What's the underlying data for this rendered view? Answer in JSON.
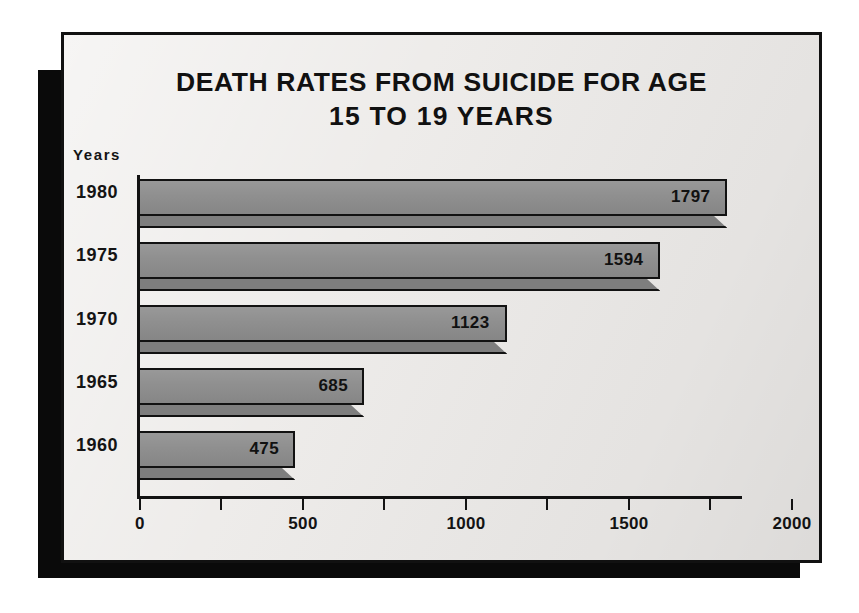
{
  "card": {
    "background_color": "#edebe9",
    "border_color": "#111111",
    "shadow_color": "#0a0a0a"
  },
  "title": {
    "line1": "DEATH RATES FROM SUICIDE FOR AGE",
    "line2": "15 TO 19 YEARS"
  },
  "axis": {
    "y_axis_title": "Years",
    "x_tick_labels": [
      "0",
      "500",
      "1000",
      "1500",
      "2000"
    ],
    "x_tick_values": [
      0,
      500,
      1000,
      1500,
      2000
    ],
    "x_minor_tick_values": [
      250,
      750,
      1250,
      1750
    ]
  },
  "chart_data": {
    "type": "bar",
    "orientation": "horizontal",
    "title": "DEATH RATES FROM SUICIDE FOR AGE 15 TO 19 YEARS",
    "xlabel": "",
    "ylabel": "Years",
    "categories": [
      "1980",
      "1975",
      "1970",
      "1965",
      "1960"
    ],
    "values": [
      1797,
      1594,
      1123,
      685,
      475
    ],
    "data_labels": [
      "1797",
      "1594",
      "1123",
      "685",
      "475"
    ],
    "xlim": [
      0,
      2000
    ],
    "xticks": [
      0,
      500,
      1000,
      1500,
      2000
    ],
    "grid": false,
    "legend": false,
    "bar_color": "#8d8d8d",
    "bar_edge_color": "#121212",
    "style": "3d-ribbon"
  }
}
